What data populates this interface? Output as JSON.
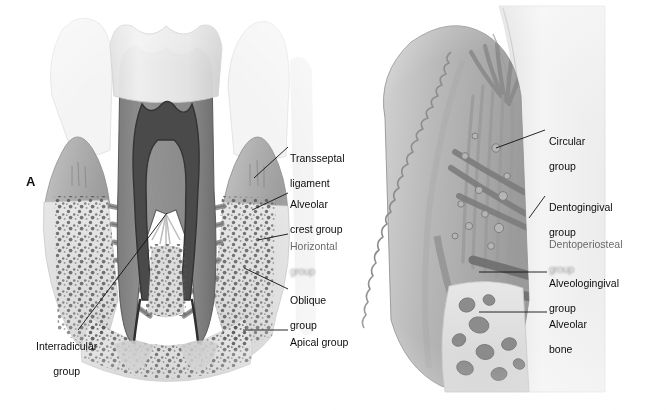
{
  "figure": {
    "background_color": "#ffffff",
    "width": 666,
    "height": 410
  },
  "panels": [
    {
      "id": "A",
      "letter": "A",
      "caption": "Principal fiber groups of the periodontal ligament (buccolingual section of a multirooted tooth)",
      "labels": [
        {
          "id": "transseptal",
          "text": "Transseptal\nligament",
          "line1": "Transseptal",
          "line2": "ligament",
          "degraded": false
        },
        {
          "id": "alveolar-crest",
          "text": "Alveolar\ncrest group",
          "line1": "Alveolar",
          "line2": "crest group",
          "degraded": false
        },
        {
          "id": "horizontal",
          "text": "Horizontal\ngroup",
          "line1": "Horizontal",
          "line2": "group",
          "degraded": true
        },
        {
          "id": "oblique",
          "text": "Oblique\ngroup",
          "line1": "Oblique",
          "line2": "group",
          "degraded": false
        },
        {
          "id": "apical",
          "text": "Apical group",
          "line1": "Apical group",
          "line2": "",
          "degraded": false
        },
        {
          "id": "interradicular",
          "text": "Interradicular\ngroup",
          "line1": "Interradicular",
          "line2": "group",
          "degraded": false
        }
      ]
    },
    {
      "id": "B",
      "letter": "B",
      "caption": "Gingival fiber groups (facial section through the marginal gingiva)",
      "labels": [
        {
          "id": "circular",
          "text": "Circular\ngroup",
          "line1": "Circular",
          "line2": "group",
          "degraded": false
        },
        {
          "id": "dentogingival",
          "text": "Dentogingival\ngroup",
          "line1": "Dentogingival",
          "line2": "group",
          "degraded": false
        },
        {
          "id": "dentoperiosteal",
          "text": "Dentoperiosteal\ngroup",
          "line1": "Dentoperiosteal",
          "line2": "group",
          "degraded": true
        },
        {
          "id": "alveologingival",
          "text": "Alveologingival\ngroup",
          "line1": "Alveologingival",
          "line2": "group",
          "degraded": false
        },
        {
          "id": "alveolar-bone",
          "text": "Alveolar\nbone",
          "line1": "Alveolar",
          "line2": "bone",
          "degraded": false
        }
      ]
    }
  ],
  "palette": {
    "background": "#ffffff",
    "enamel": "#e9e9e9",
    "enamel_shadow": "#d2d2d2",
    "dentin": "#8c8c8c",
    "dentin_dark": "#6f6f6f",
    "pulp": "#4a4a4a",
    "pulp_outline": "#3a3a3a",
    "gingiva": "#b4b4b4",
    "gingiva_light": "#c9c9c9",
    "bone": "#d8d8d8",
    "bone_trabecula": "#5a5a5a",
    "ligament_fiber": "#9a9a9a",
    "ligament_fiber_dark": "#7a7a7a",
    "leader_line": "#111111",
    "label_text": "#0d0d0d",
    "label_text_degraded": "#575757"
  }
}
